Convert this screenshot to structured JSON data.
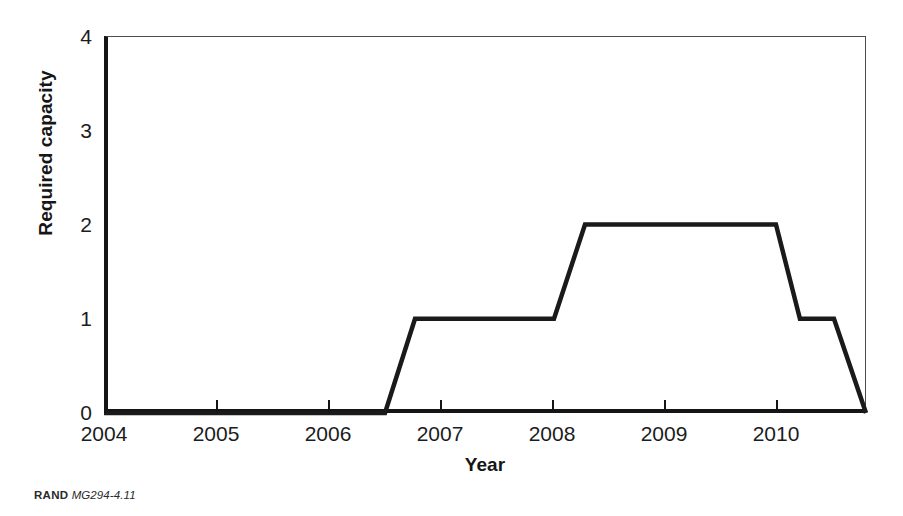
{
  "figure": {
    "background_color": "#ffffff",
    "line_color": "#1a1a1a",
    "axis_color": "#151515",
    "frame_color": "#4c4c4c"
  },
  "credit": {
    "organization": "RAND",
    "document_id": "MG294-4.11"
  },
  "chart_data": {
    "type": "line",
    "title": "",
    "subtitle": "",
    "xlabel": "Year",
    "ylabel": "Required capacity",
    "xlim": [
      2004,
      2010.804
    ],
    "ylim": [
      0,
      4
    ],
    "grid": false,
    "legend": null,
    "x_ticks": [
      2004,
      2005,
      2006,
      2007,
      2008,
      2009,
      2010
    ],
    "x_tick_labels": [
      "2004",
      "2005",
      "2006",
      "2007",
      "2008",
      "2009",
      "2010"
    ],
    "y_ticks": [
      0,
      1,
      2,
      3,
      4
    ],
    "y_tick_labels": [
      "0",
      "1",
      "2",
      "3",
      "4"
    ],
    "series": [
      {
        "name": "Required capacity",
        "color": "#1a1a1a",
        "line_width": 4,
        "x": [
          2004.0,
          2006.509,
          2006.777,
          2008.018,
          2008.295,
          2010.0,
          2010.214,
          2010.518,
          2010.804
        ],
        "y": [
          0,
          0,
          1,
          1,
          2,
          2,
          1,
          1,
          0
        ]
      }
    ],
    "annotations": []
  }
}
